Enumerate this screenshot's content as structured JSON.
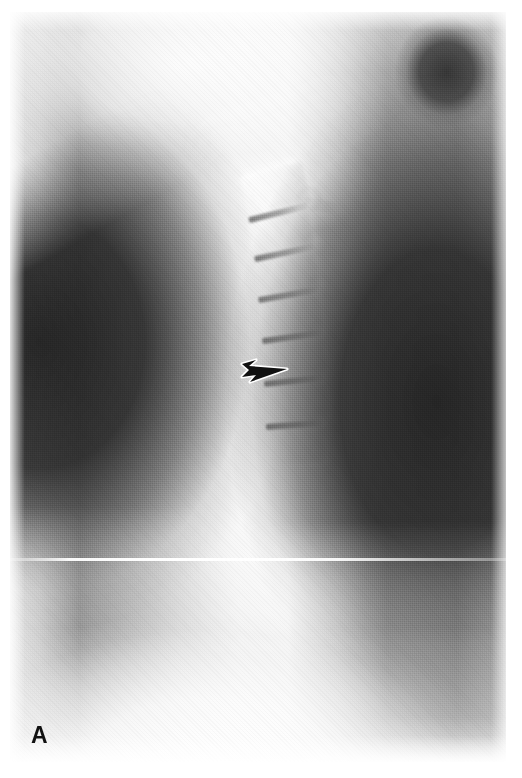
{
  "figure": {
    "domain": "Natural-Image",
    "modality": "radiograph",
    "view": "lateral cervical spine",
    "panel_label": "A",
    "background_color": "#ffffff",
    "width": 522,
    "height": 778
  },
  "plate": {
    "left": 10,
    "top": 12,
    "width": 496,
    "height": 750,
    "film_base_color": "#d8d8d8",
    "bright_tissue_color": "#fafafa",
    "dark_air_color": "#2b2b2b"
  },
  "annotations": {
    "arrow": {
      "name": "arrow-marker",
      "shape": "solid-black-arrowhead-with-white-outline",
      "direction": "right",
      "fill_color": "#111111",
      "outline_color": "#ffffff",
      "left": 240,
      "top": 351,
      "width": 50,
      "height": 38
    },
    "scanline": {
      "name": "scanline-artifact",
      "top": 558,
      "color": "#ffffff"
    }
  },
  "anatomy": {
    "regions": [
      {
        "name": "cranial-base-mandible",
        "tone": "bright"
      },
      {
        "name": "occiput-air-shadow",
        "tone": "dark"
      },
      {
        "name": "anterior-soft-tissue-air",
        "tone": "dark"
      },
      {
        "name": "posterior-soft-tissue-air",
        "tone": "dark"
      },
      {
        "name": "cervical-soft-tissue-column",
        "tone": "bright"
      },
      {
        "name": "shoulder-upper-chest",
        "tone": "bright"
      }
    ],
    "vertebrae": [
      {
        "label": "C2",
        "x": 244,
        "y": 168,
        "w": 64,
        "h": 44,
        "rot": -14
      },
      {
        "label": "C3",
        "x": 250,
        "y": 214,
        "w": 62,
        "h": 38,
        "rot": -12
      },
      {
        "label": "C4",
        "x": 256,
        "y": 256,
        "w": 62,
        "h": 38,
        "rot": -10
      },
      {
        "label": "C5",
        "x": 260,
        "y": 298,
        "w": 62,
        "h": 38,
        "rot": -8
      },
      {
        "label": "C6",
        "x": 264,
        "y": 340,
        "w": 62,
        "h": 38,
        "rot": -6
      },
      {
        "label": "C7",
        "x": 266,
        "y": 384,
        "w": 62,
        "h": 38,
        "rot": -4
      },
      {
        "label": "T1",
        "x": 266,
        "y": 428,
        "w": 60,
        "h": 36,
        "rot": -2
      }
    ],
    "disc_spaces": [
      {
        "x": 248,
        "y": 210,
        "w": 60,
        "h": 6,
        "rot": -14
      },
      {
        "x": 254,
        "y": 250,
        "w": 60,
        "h": 6,
        "rot": -12
      },
      {
        "x": 258,
        "y": 292,
        "w": 60,
        "h": 6,
        "rot": -10
      },
      {
        "x": 262,
        "y": 334,
        "w": 60,
        "h": 6,
        "rot": -8
      },
      {
        "x": 264,
        "y": 378,
        "w": 58,
        "h": 6,
        "rot": -6
      },
      {
        "x": 266,
        "y": 422,
        "w": 56,
        "h": 6,
        "rot": -4
      }
    ],
    "spinous_processes": [
      {
        "x": 300,
        "y": 200,
        "w": 46,
        "h": 12,
        "rot": 12
      },
      {
        "x": 306,
        "y": 244,
        "w": 46,
        "h": 12,
        "rot": 10
      },
      {
        "x": 310,
        "y": 288,
        "w": 46,
        "h": 12,
        "rot": 8
      },
      {
        "x": 312,
        "y": 332,
        "w": 44,
        "h": 12,
        "rot": 6
      },
      {
        "x": 314,
        "y": 376,
        "w": 44,
        "h": 12,
        "rot": 5
      },
      {
        "x": 314,
        "y": 420,
        "w": 42,
        "h": 12,
        "rot": 4
      }
    ],
    "facets": [
      {
        "x": 296,
        "y": 186,
        "d": 26
      },
      {
        "x": 302,
        "y": 230,
        "d": 26
      },
      {
        "x": 306,
        "y": 274,
        "d": 26
      },
      {
        "x": 308,
        "y": 318,
        "d": 26
      },
      {
        "x": 310,
        "y": 362,
        "d": 26
      },
      {
        "x": 310,
        "y": 406,
        "d": 26
      }
    ]
  }
}
